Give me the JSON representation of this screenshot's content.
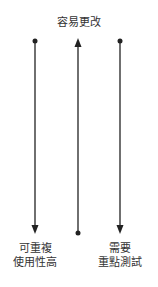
{
  "diagram": {
    "top_label": "容易更改",
    "left_label_line1": "可重複",
    "left_label_line2": "使用性高",
    "right_label_line1": "需要",
    "right_label_line2": "重點測試",
    "arrows": [
      {
        "name": "left",
        "x": 35,
        "from_y": 41,
        "to_y": 233,
        "direction": "down"
      },
      {
        "name": "middle",
        "x": 78,
        "from_y": 233,
        "to_y": 38,
        "direction": "up"
      },
      {
        "name": "right",
        "x": 120,
        "from_y": 41,
        "to_y": 233,
        "direction": "down"
      }
    ],
    "line_color": "#222222"
  }
}
